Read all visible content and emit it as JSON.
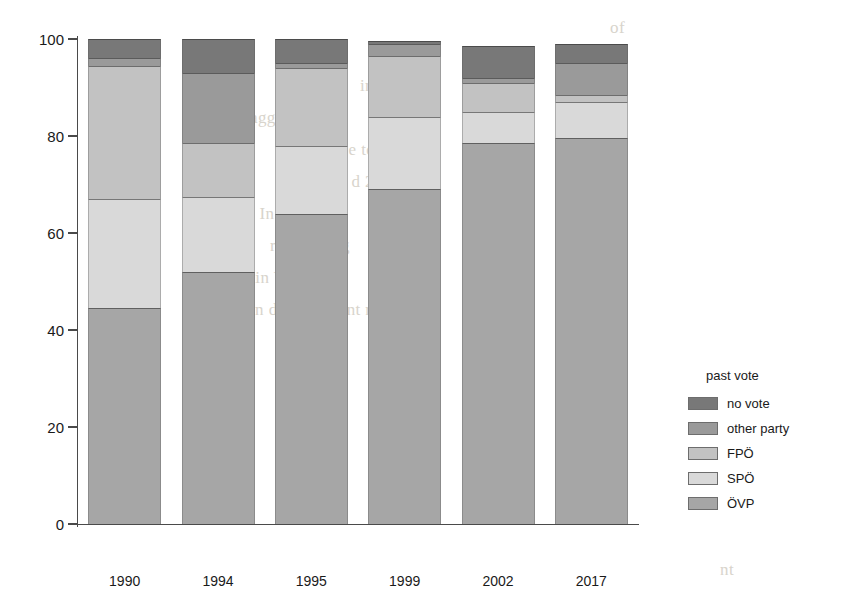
{
  "chart_data": {
    "type": "bar",
    "subtype": "stacked-percentage",
    "title": "",
    "xlabel": "",
    "ylabel": "",
    "ylim": [
      0,
      100
    ],
    "yticks": [
      0,
      20,
      40,
      60,
      80,
      100
    ],
    "grid": false,
    "legend_position": "right",
    "legend_title": "past vote",
    "categories": [
      "1990",
      "1994",
      "1995",
      "1999",
      "2002",
      "2017"
    ],
    "series": [
      {
        "name": "ÖVP",
        "color": "#a6a6a6",
        "values": [
          44.5,
          52.0,
          64.0,
          69.0,
          78.5,
          79.5
        ]
      },
      {
        "name": "SPÖ",
        "color": "#d9d9d9",
        "values": [
          22.5,
          15.5,
          14.0,
          15.0,
          6.5,
          7.5
        ]
      },
      {
        "name": "FPÖ",
        "color": "#c2c2c2",
        "values": [
          27.5,
          11.0,
          16.0,
          12.5,
          6.0,
          1.5
        ]
      },
      {
        "name": "other party",
        "color": "#9a9a9a",
        "values": [
          1.5,
          14.5,
          1.0,
          2.5,
          1.0,
          6.5
        ]
      },
      {
        "name": "no vote",
        "color": "#787878",
        "values": [
          4.0,
          7.0,
          5.0,
          0.5,
          6.5,
          4.0
        ]
      }
    ],
    "stack_order_bottom_to_top": [
      "ÖVP",
      "SPÖ",
      "FPÖ",
      "other party",
      "no vote"
    ],
    "legend_order_top_to_bottom": [
      "no vote",
      "other party",
      "FPÖ",
      "SPÖ",
      "ÖVP"
    ]
  },
  "axis": {
    "y_tick_labels": [
      "100",
      "80",
      "60",
      "40",
      "20",
      "0"
    ],
    "y_tick_values": [
      100,
      80,
      60,
      40,
      20,
      0
    ]
  },
  "legend": {
    "title": "past vote",
    "items": [
      {
        "label": "no vote",
        "color": "#787878"
      },
      {
        "label": "other party",
        "color": "#9a9a9a"
      },
      {
        "label": "FPÖ",
        "color": "#c2c2c2"
      },
      {
        "label": "SPÖ",
        "color": "#d9d9d9"
      },
      {
        "label": "ÖVP",
        "color": "#a6a6a6"
      }
    ]
  },
  "background_text": {
    "lines": [
      "of",
      "arn",
      "in d",
      "agge t in",
      "ch, du e to",
      "an d 201 7",
      "tes. In all T1 t",
      "rely cha ng",
      "y col lin VP as",
      "in d ut o f c ont ro l",
      "tion",
      "nt"
    ]
  }
}
